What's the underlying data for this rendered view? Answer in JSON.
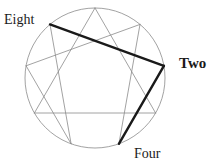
{
  "diagram": {
    "type": "enneagram",
    "background_color": "#ffffff",
    "circle": {
      "center_x": 95,
      "center_y": 78,
      "radius": 70,
      "stroke_color": "#8a8a8a",
      "stroke_width": 0.8
    },
    "thin_line_color": "#8a8a8a",
    "thin_line_width": 0.8,
    "thick_line_color": "#1a1a1a",
    "thick_line_width": 2.4,
    "points": [
      {
        "number": 9,
        "angle_deg": -90,
        "x": 95,
        "y": 8
      },
      {
        "number": 1,
        "angle_deg": -50,
        "x": 140,
        "y": 24.4
      },
      {
        "number": 2,
        "angle_deg": -10,
        "x": 163.9,
        "y": 65.8
      },
      {
        "number": 3,
        "angle_deg": 30,
        "x": 155.6,
        "y": 113
      },
      {
        "number": 4,
        "angle_deg": 70,
        "x": 118.9,
        "y": 143.8
      },
      {
        "number": 5,
        "angle_deg": 110,
        "x": 71.1,
        "y": 143.8
      },
      {
        "number": 6,
        "angle_deg": 150,
        "x": 34.4,
        "y": 113
      },
      {
        "number": 7,
        "angle_deg": 190,
        "x": 26.1,
        "y": 65.8
      },
      {
        "number": 8,
        "angle_deg": 230,
        "x": 50,
        "y": 24.4
      }
    ],
    "thin_edges": [
      {
        "from": 9,
        "to": 3
      },
      {
        "from": 3,
        "to": 6
      },
      {
        "from": 6,
        "to": 9
      },
      {
        "from": 1,
        "to": 4
      },
      {
        "from": 4,
        "to": 2
      },
      {
        "from": 2,
        "to": 8
      },
      {
        "from": 8,
        "to": 5
      },
      {
        "from": 5,
        "to": 7
      },
      {
        "from": 7,
        "to": 1
      }
    ],
    "thick_edges": [
      {
        "from": 8,
        "to": 2
      },
      {
        "from": 2,
        "to": 4
      }
    ],
    "labels": [
      {
        "key": "eight",
        "text": "Eight",
        "point": 8,
        "bold": false
      },
      {
        "key": "two",
        "text": "Two",
        "point": 2,
        "bold": true
      },
      {
        "key": "four",
        "text": "Four",
        "point": 4,
        "bold": false
      }
    ]
  }
}
